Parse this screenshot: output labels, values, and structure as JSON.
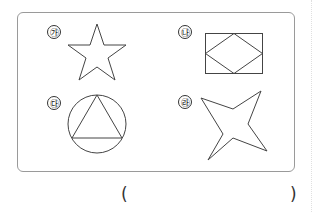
{
  "figures": [
    {
      "label": "㉮",
      "shape": "five-point-star"
    },
    {
      "label": "㉯",
      "shape": "rectangle-with-inscribed-rhombus"
    },
    {
      "label": "㉰",
      "shape": "circle-with-inscribed-triangle"
    },
    {
      "label": "㉱",
      "shape": "four-point-star"
    }
  ],
  "answer": {
    "open": "(",
    "close": ")",
    "value": ""
  },
  "colors": {
    "stroke": "#444444",
    "border": "#9a9a9a"
  }
}
